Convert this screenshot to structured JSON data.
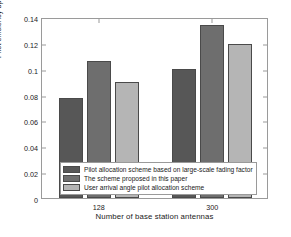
{
  "chart_data": {
    "type": "bar",
    "title": "",
    "xlabel": "Number of base station antennas",
    "ylabel": "Pilot efficiency bps/Hz",
    "categories": [
      "128",
      "300"
    ],
    "series": [
      {
        "name": "Pilot allocation scheme based on large-scale fading factor",
        "values": [
          0.077,
          0.1
        ],
        "color": "#575757"
      },
      {
        "name": "The scheme proposed in this paper",
        "values": [
          0.106,
          0.134
        ],
        "color": "#6e6e6e"
      },
      {
        "name": "User arrival angle pilot allocation scheme",
        "values": [
          0.09,
          0.119
        ],
        "color": "#b5b5b5"
      }
    ],
    "ylim": [
      0,
      0.14
    ],
    "yticks": [
      "0",
      "0.02",
      "0.04",
      "0.06",
      "0.08",
      "0.1",
      "0.12",
      "0.14"
    ],
    "ytick_values": [
      0,
      0.02,
      0.04,
      0.06,
      0.08,
      0.1,
      0.12,
      0.14
    ],
    "grid": false,
    "legend_position": "lower-left-inside",
    "axis_color": "#9a9a9a",
    "background": "#ffffff"
  }
}
